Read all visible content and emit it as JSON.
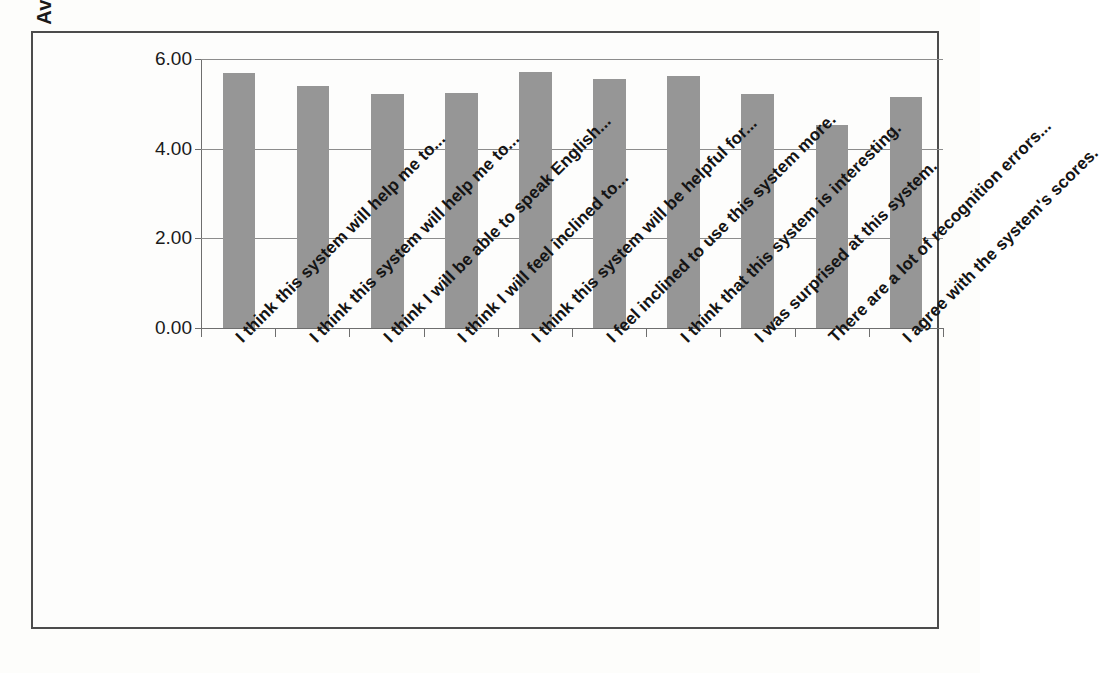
{
  "figure": {
    "background_color": "#fdfdfb",
    "frame_color": "#4c4c4c"
  },
  "chart_data": {
    "type": "bar",
    "title": "",
    "subtitle": "",
    "xlabel": "",
    "ylabel": "Average Scores",
    "ylim": [
      0,
      6
    ],
    "ytick_labels": [
      "0.00",
      "2.00",
      "4.00",
      "6.00"
    ],
    "ytick_values": [
      0,
      2,
      4,
      6
    ],
    "grid": true,
    "grid_axis": "y",
    "legend": false,
    "legend_position": "none",
    "bar_color": "#969696",
    "categories": [
      "I think this system will help me to...",
      "I think this system will help me to...",
      "I think I will be able to speak English...",
      "I think I will feel inclined to...",
      "I think this system will be helpful for...",
      "I feel inclined to use this system more.",
      "I think that this system is interesting.",
      "I was surprised at this system.",
      "There are a lot of recognition errors...",
      "I agree with the system's scores."
    ],
    "values": [
      5.69,
      5.4,
      5.23,
      5.25,
      5.7,
      5.56,
      5.62,
      5.23,
      4.52,
      5.15
    ]
  }
}
